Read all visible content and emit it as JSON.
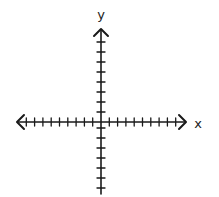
{
  "diagram": {
    "type": "coordinate_plane",
    "colors": {
      "stroke": "#1a1a1a",
      "background": "#ffffff"
    },
    "origin": {
      "x": 101,
      "y": 122
    },
    "x_axis": {
      "label": "x",
      "label_pos": {
        "x": 198,
        "y": 128
      },
      "left_end": 17,
      "right_end": 186,
      "tick_spacing": 8.3,
      "ticks_left": 9,
      "ticks_right": 9,
      "arrows": "both"
    },
    "y_axis": {
      "label": "y",
      "label_pos": {
        "x": 101,
        "y": 19
      },
      "top_end": 29,
      "bottom_end": 194,
      "tick_spacing": 10,
      "ticks_up": 8,
      "ticks_down": 7,
      "arrows": "top"
    }
  }
}
